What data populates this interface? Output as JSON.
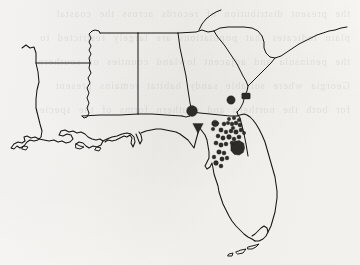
{
  "figure": {
    "kind": "scanned-distribution-map",
    "region": "Southeastern United States",
    "background_color": "#f6f5f3",
    "ink_color": "#161513",
    "marker_color": "#2e2c29",
    "width": 360,
    "height": 265,
    "caption": "",
    "title": "",
    "legend": "",
    "axis_labels": "",
    "bleed_through_text": "the present distribution of records across the coastal\nplain indicates that populations are largely restricted to\nthe peninsula and adjacent lowland counties of southern\nGeorgia where suitable sandy habitat remains present\nfor both the northern and southern forms of the species"
  },
  "states": [
    {
      "id": "louisiana",
      "name": "Louisiana"
    },
    {
      "id": "mississippi",
      "name": "Mississippi"
    },
    {
      "id": "alabama",
      "name": "Alabama"
    },
    {
      "id": "georgia",
      "name": "Georgia"
    },
    {
      "id": "south-carolina",
      "name": "South Carolina"
    },
    {
      "id": "florida",
      "name": "Florida"
    }
  ],
  "geometry": {
    "outline": "M 12,148 L 18,144 L 24,147 L 28,145 L 31,148 L 36,147 L 40,143 L 44,144 L 47,141 L 52,142 L 56,139 L 60,141 L 63,138 L 66,140 L 70,138 L 74,140 L 80,139 L 86,141 L 90,139 L 95,141 L 99,139 L 104,141 L 108,139 L 112,141 L 116,139 L 118,136 L 114,133 L 111,135 L 108,133 L 106,136 L 103,134 L 101,137 L 98,135 L 96,138 L 93,136 L 90,139 L 88,136 L 85,138 L 82,135 L 79,137 L 76,134 L 73,136 L 70,133 L 67,135 L 64,132 L 60,134 L 57,131 L 54,133 L 50,130 L 47,133 L 44,130 L 41,132 L 38,129 L 35,131 L 32,133 L 30,137 L 27,134 L 24,136 L 21,133 L 17,135 L 14,132 L 11,136 L 9,141 L 12,148 Z",
    "note": "outline is rendered as explicit sub-paths in the template svg"
  },
  "markers": [
    {
      "id": "m01",
      "shape": "circle",
      "cx": 192,
      "cy": 111,
      "r": 5.4,
      "state": "georgia"
    },
    {
      "id": "m02",
      "shape": "circle",
      "cx": 231,
      "cy": 100,
      "r": 4.2,
      "state": "georgia"
    },
    {
      "id": "m03",
      "shape": "rect",
      "cx": 246,
      "cy": 96,
      "w": 8.5,
      "h": 6.0,
      "state": "south-carolina"
    },
    {
      "id": "m04",
      "shape": "blob",
      "cx": 215,
      "cy": 123,
      "r": 3.6,
      "state": "georgia"
    },
    {
      "id": "m05",
      "shape": "triangle",
      "cx": 198,
      "cy": 128,
      "r": 5.2,
      "state": "florida"
    },
    {
      "id": "m06",
      "shape": "circle",
      "cx": 224,
      "cy": 124,
      "r": 2.0,
      "state": "florida"
    },
    {
      "id": "m07",
      "shape": "circle",
      "cx": 228,
      "cy": 123,
      "r": 1.8,
      "state": "florida"
    },
    {
      "id": "m08",
      "shape": "circle",
      "cx": 232,
      "cy": 124,
      "r": 1.9,
      "state": "florida"
    },
    {
      "id": "m09",
      "shape": "circle",
      "cx": 236,
      "cy": 123,
      "r": 2.0,
      "state": "florida"
    },
    {
      "id": "m10",
      "shape": "circle",
      "cx": 240,
      "cy": 125,
      "r": 2.1,
      "state": "florida"
    },
    {
      "id": "m11",
      "shape": "circle",
      "cx": 221,
      "cy": 130,
      "r": 2.2,
      "state": "florida"
    },
    {
      "id": "m12",
      "shape": "circle",
      "cx": 226,
      "cy": 132,
      "r": 1.9,
      "state": "florida"
    },
    {
      "id": "m13",
      "shape": "circle",
      "cx": 231,
      "cy": 131,
      "r": 2.0,
      "state": "florida"
    },
    {
      "id": "m14",
      "shape": "circle",
      "cx": 236,
      "cy": 132,
      "r": 2.3,
      "state": "florida"
    },
    {
      "id": "m15",
      "shape": "circle",
      "cx": 241,
      "cy": 130,
      "r": 2.0,
      "state": "florida"
    },
    {
      "id": "m16",
      "shape": "circle",
      "cx": 218,
      "cy": 136,
      "r": 2.0,
      "state": "florida"
    },
    {
      "id": "m17",
      "shape": "circle",
      "cx": 223,
      "cy": 138,
      "r": 2.2,
      "state": "florida"
    },
    {
      "id": "m18",
      "shape": "circle",
      "cx": 229,
      "cy": 137,
      "r": 2.4,
      "state": "florida"
    },
    {
      "id": "m19",
      "shape": "circle",
      "cx": 234,
      "cy": 139,
      "r": 2.0,
      "state": "florida"
    },
    {
      "id": "m20",
      "shape": "circle",
      "cx": 239,
      "cy": 137,
      "r": 2.1,
      "state": "florida"
    },
    {
      "id": "m21",
      "shape": "circle",
      "cx": 216,
      "cy": 143,
      "r": 2.1,
      "state": "florida"
    },
    {
      "id": "m22",
      "shape": "circle",
      "cx": 221,
      "cy": 145,
      "r": 2.2,
      "state": "florida"
    },
    {
      "id": "m23",
      "shape": "circle",
      "cx": 226,
      "cy": 144,
      "r": 2.0,
      "state": "florida"
    },
    {
      "id": "m24",
      "shape": "blob",
      "cx": 238,
      "cy": 148,
      "r": 6.4,
      "state": "florida"
    },
    {
      "id": "m25",
      "shape": "circle",
      "cx": 219,
      "cy": 152,
      "r": 2.3,
      "state": "florida"
    },
    {
      "id": "m26",
      "shape": "circle",
      "cx": 224,
      "cy": 153,
      "r": 2.0,
      "state": "florida"
    },
    {
      "id": "m27",
      "shape": "circle",
      "cx": 222,
      "cy": 159,
      "r": 2.2,
      "state": "florida"
    },
    {
      "id": "m28",
      "shape": "circle",
      "cx": 227,
      "cy": 158,
      "r": 1.9,
      "state": "florida"
    },
    {
      "id": "m29",
      "shape": "circle",
      "cx": 216,
      "cy": 163,
      "r": 2.4,
      "state": "florida"
    },
    {
      "id": "m30",
      "shape": "circle",
      "cx": 221,
      "cy": 166,
      "r": 2.0,
      "state": "florida"
    },
    {
      "id": "m31",
      "shape": "circle",
      "cx": 229,
      "cy": 119,
      "r": 1.7,
      "state": "florida"
    },
    {
      "id": "m32",
      "shape": "circle",
      "cx": 234,
      "cy": 118,
      "r": 1.8,
      "state": "florida"
    },
    {
      "id": "m33",
      "shape": "circle",
      "cx": 239,
      "cy": 120,
      "r": 1.8,
      "state": "florida"
    },
    {
      "id": "m34",
      "shape": "circle",
      "cx": 213,
      "cy": 129,
      "r": 1.8,
      "state": "florida"
    },
    {
      "id": "m35",
      "shape": "circle",
      "cx": 232,
      "cy": 143,
      "r": 2.0,
      "state": "florida"
    },
    {
      "id": "m36",
      "shape": "circle",
      "cx": 214,
      "cy": 157,
      "r": 1.9,
      "state": "florida"
    },
    {
      "id": "m37",
      "shape": "circle",
      "cx": 233,
      "cy": 128,
      "r": 1.8,
      "state": "florida"
    },
    {
      "id": "m38",
      "shape": "circle",
      "cx": 244,
      "cy": 133,
      "r": 1.7,
      "state": "florida"
    }
  ],
  "marker_summary": {
    "total": 38,
    "large_symbols": 5,
    "small_points": 33,
    "densest_state": "Florida"
  }
}
